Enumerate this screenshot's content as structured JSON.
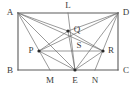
{
  "figure": {
    "kind": "geometry-diagram",
    "width": 136,
    "height": 87,
    "stroke_color": "#6e6e6e",
    "rect_stroke_color": "#5a5a5a",
    "label_color": "#3a3a3a",
    "dot_color": "#2b2b2b",
    "background": "#ffffff",
    "vertices": [
      {
        "id": "A",
        "label": "A",
        "x": 18,
        "y": 13,
        "label_x": 10,
        "label_y": 12,
        "dot": false
      },
      {
        "id": "D",
        "label": "D",
        "x": 118,
        "y": 13,
        "label_x": 126,
        "label_y": 12,
        "dot": false
      },
      {
        "id": "B",
        "label": "B",
        "x": 18,
        "y": 70,
        "label_x": 10,
        "label_y": 70,
        "dot": false
      },
      {
        "id": "C",
        "label": "C",
        "x": 118,
        "y": 70,
        "label_x": 126,
        "label_y": 70,
        "dot": false
      },
      {
        "id": "L",
        "label": "L",
        "x": 68,
        "y": 13,
        "label_x": 68,
        "label_y": 5,
        "dot": false
      },
      {
        "id": "Q",
        "label": "Q",
        "x": 68,
        "y": 31,
        "label_x": 77,
        "label_y": 29,
        "dot": true
      },
      {
        "id": "P",
        "label": "P",
        "x": 39,
        "y": 51,
        "label_x": 31,
        "label_y": 50,
        "dot": true
      },
      {
        "id": "R",
        "label": "R",
        "x": 103,
        "y": 51,
        "label_x": 111,
        "label_y": 50,
        "dot": true
      },
      {
        "id": "S",
        "label": "S",
        "x": 76,
        "y": 51,
        "label_x": 79,
        "label_y": 45,
        "dot": false
      },
      {
        "id": "M",
        "label": "M",
        "x": 50,
        "y": 70,
        "label_x": 50,
        "label_y": 80,
        "dot": false
      },
      {
        "id": "E",
        "label": "E",
        "x": 75,
        "y": 70,
        "label_x": 75,
        "label_y": 80,
        "dot": true
      },
      {
        "id": "N",
        "label": "N",
        "x": 95,
        "y": 70,
        "label_x": 95,
        "label_y": 80,
        "dot": false
      }
    ],
    "segments": [
      {
        "name": "side-AD",
        "from": "A",
        "to": "D"
      },
      {
        "name": "side-DC",
        "from": "D",
        "to": "C"
      },
      {
        "name": "side-CB",
        "from": "C",
        "to": "B"
      },
      {
        "name": "side-BA",
        "from": "B",
        "to": "A"
      },
      {
        "name": "segment-AQ",
        "from": "A",
        "to": "Q"
      },
      {
        "name": "segment-AR",
        "from": "A",
        "to": "R"
      },
      {
        "name": "segment-AE",
        "from": "A",
        "to": "E"
      },
      {
        "name": "segment-AM",
        "from": "A",
        "to": "M"
      },
      {
        "name": "segment-DQ",
        "from": "D",
        "to": "Q"
      },
      {
        "name": "segment-DP",
        "from": "D",
        "to": "P"
      },
      {
        "name": "segment-DE",
        "from": "D",
        "to": "E"
      },
      {
        "name": "segment-DN",
        "from": "D",
        "to": "N"
      },
      {
        "name": "segment-PR",
        "from": "P",
        "to": "R"
      },
      {
        "name": "segment-PQ",
        "from": "P",
        "to": "Q"
      },
      {
        "name": "segment-QR",
        "from": "Q",
        "to": "R"
      },
      {
        "name": "segment-PE",
        "from": "P",
        "to": "E"
      },
      {
        "name": "segment-RE",
        "from": "R",
        "to": "E"
      },
      {
        "name": "segment-QE",
        "from": "Q",
        "to": "E"
      },
      {
        "name": "segment-LE",
        "from": "L",
        "to": "E"
      }
    ]
  }
}
